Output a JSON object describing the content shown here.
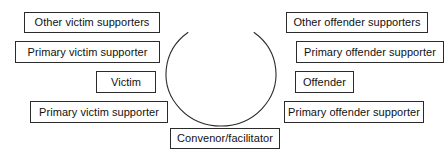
{
  "diagram": {
    "canvas": {
      "width": 448,
      "height": 158,
      "background": "#ffffff"
    },
    "stroke_color": "#2b2b2b",
    "text_color": "#111111",
    "circle": {
      "label": "conference-circle-arc",
      "center_x": 221,
      "center_y": 74,
      "radius_x": 55,
      "radius_y": 52,
      "gap_at": "top",
      "gap_degrees": 74,
      "stroke_width": 1
    },
    "nodes": [
      {
        "id": "other-victim-supporters",
        "label": "Other victim supporters",
        "side": "left",
        "x": 24,
        "y": 12,
        "w": 136,
        "h": 21
      },
      {
        "id": "primary-victim-supporter-upper",
        "label": "Primary victim supporter",
        "side": "left",
        "x": 15,
        "y": 41,
        "w": 145,
        "h": 22
      },
      {
        "id": "victim",
        "label": "Victim",
        "side": "left",
        "x": 96,
        "y": 71,
        "w": 60,
        "h": 22
      },
      {
        "id": "primary-victim-supporter-lower",
        "label": "Primary victim supporter",
        "side": "left",
        "x": 30,
        "y": 101,
        "w": 138,
        "h": 22
      },
      {
        "id": "other-offender-supporters",
        "label": "Other offender supporters",
        "side": "right",
        "x": 286,
        "y": 12,
        "w": 142,
        "h": 21
      },
      {
        "id": "primary-offender-supporter-upper",
        "label": "Primary offender supporter",
        "side": "right",
        "x": 296,
        "y": 41,
        "w": 148,
        "h": 22
      },
      {
        "id": "offender",
        "label": "Offender",
        "side": "right",
        "x": 295,
        "y": 71,
        "w": 59,
        "h": 22
      },
      {
        "id": "primary-offender-supporter-lower",
        "label": "Primary offender supporter",
        "side": "right",
        "x": 284,
        "y": 101,
        "w": 140,
        "h": 22
      },
      {
        "id": "convenor-facilitator",
        "label": "Convenor/facilitator",
        "side": "bottom",
        "x": 170,
        "y": 128,
        "w": 110,
        "h": 21
      }
    ]
  }
}
